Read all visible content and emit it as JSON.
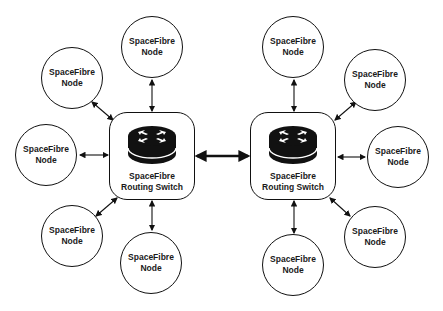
{
  "diagram": {
    "node_label_line1": "SpaceFibre",
    "node_label_line2": "Node",
    "switches": [
      {
        "line1": "SpaceFibre",
        "line2": "Routing Switch",
        "icon": "router-icon"
      },
      {
        "line1": "SpaceFibre",
        "line2": "Routing Switch",
        "icon": "router-icon"
      }
    ],
    "nodes_left": [
      {
        "line1": "SpaceFibre",
        "line2": "Node"
      },
      {
        "line1": "SpaceFibre",
        "line2": "Node"
      },
      {
        "line1": "SpaceFibre",
        "line2": "Node"
      },
      {
        "line1": "SpaceFibre",
        "line2": "Node"
      },
      {
        "line1": "SpaceFibre",
        "line2": "Node"
      }
    ],
    "nodes_right": [
      {
        "line1": "SpaceFibre",
        "line2": "Node"
      },
      {
        "line1": "SpaceFibre",
        "line2": "Node"
      },
      {
        "line1": "SpaceFibre",
        "line2": "Node"
      },
      {
        "line1": "SpaceFibre",
        "line2": "Node"
      },
      {
        "line1": "SpaceFibre",
        "line2": "Node"
      }
    ],
    "colors": {
      "stroke": "#111111",
      "text": "#1a1a1a",
      "background": "#ffffff"
    }
  }
}
